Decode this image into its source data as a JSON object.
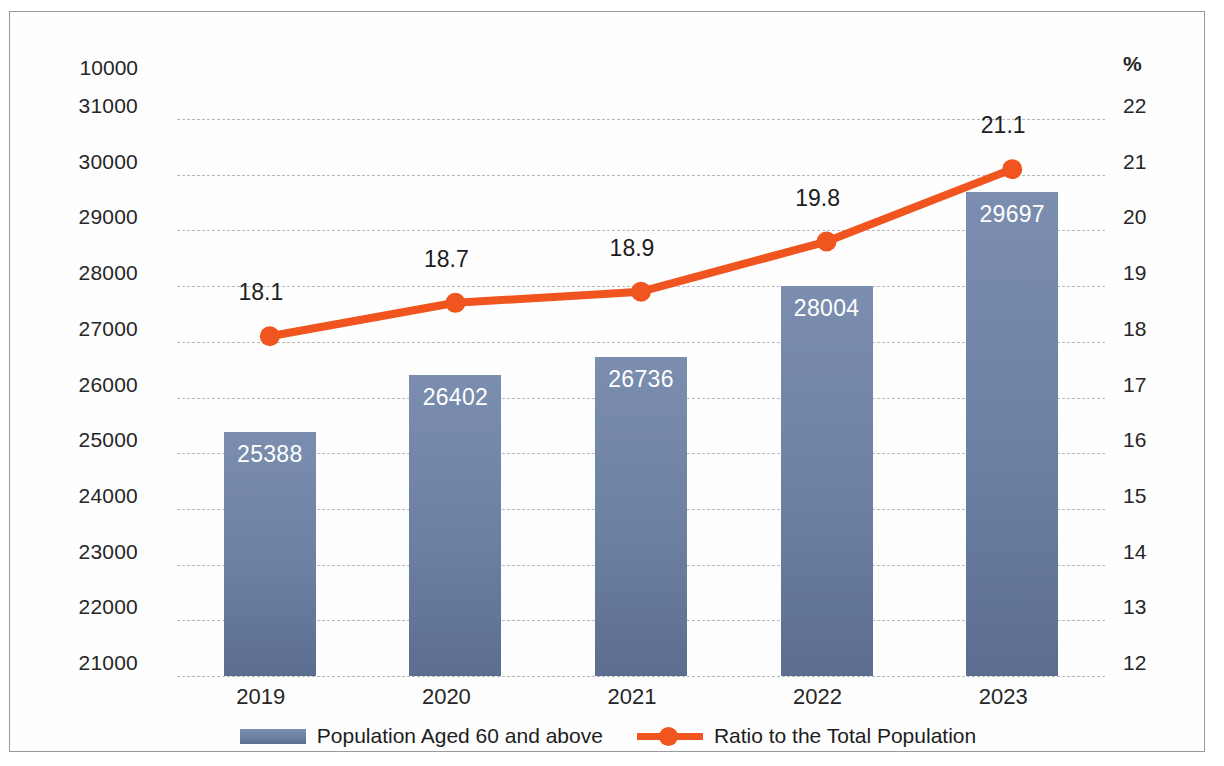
{
  "chart_data": {
    "type": "bar",
    "title": "",
    "categories": [
      "2019",
      "2020",
      "2021",
      "2022",
      "2023"
    ],
    "series": [
      {
        "name": "Population Aged 60 and above",
        "type": "bar",
        "axis": "left",
        "values": [
          25388,
          26402,
          26736,
          28004,
          29697
        ],
        "color": "#6c80a2"
      },
      {
        "name": "Ratio to the Total Population",
        "type": "line",
        "axis": "right",
        "values": [
          18.1,
          18.7,
          18.9,
          19.8,
          21.1
        ],
        "color": "#f0541f"
      }
    ],
    "xlabel": "",
    "ylabel_left": "10000",
    "ylabel_right": "%",
    "ylim_left": [
      21000,
      31000
    ],
    "ylim_right": [
      12,
      22
    ],
    "ytick_left": [
      "31000",
      "30000",
      "29000",
      "28000",
      "27000",
      "26000",
      "25000",
      "24000",
      "23000",
      "22000",
      "21000"
    ],
    "ytick_right": [
      "22",
      "21",
      "20",
      "19",
      "18",
      "17",
      "16",
      "15",
      "14",
      "13",
      "12"
    ],
    "grid": true,
    "legend_position": "bottom"
  },
  "axes": {
    "left_unit": "10000",
    "right_unit": "%",
    "left_ticks": [
      {
        "label": "31000",
        "value": 31000
      },
      {
        "label": "30000",
        "value": 30000
      },
      {
        "label": "29000",
        "value": 29000
      },
      {
        "label": "28000",
        "value": 28000
      },
      {
        "label": "27000",
        "value": 27000
      },
      {
        "label": "26000",
        "value": 26000
      },
      {
        "label": "25000",
        "value": 25000
      },
      {
        "label": "24000",
        "value": 24000
      },
      {
        "label": "23000",
        "value": 23000
      },
      {
        "label": "22000",
        "value": 22000
      },
      {
        "label": "21000",
        "value": 21000
      }
    ],
    "right_ticks": [
      {
        "label": "22",
        "value": 22
      },
      {
        "label": "21",
        "value": 21
      },
      {
        "label": "20",
        "value": 20
      },
      {
        "label": "19",
        "value": 19
      },
      {
        "label": "18",
        "value": 18
      },
      {
        "label": "17",
        "value": 17
      },
      {
        "label": "16",
        "value": 16
      },
      {
        "label": "15",
        "value": 15
      },
      {
        "label": "14",
        "value": 14
      },
      {
        "label": "13",
        "value": 13
      },
      {
        "label": "12",
        "value": 12
      }
    ],
    "categories": [
      {
        "label": "2019"
      },
      {
        "label": "2020"
      },
      {
        "label": "2021"
      },
      {
        "label": "2022"
      },
      {
        "label": "2023"
      }
    ]
  },
  "bars": [
    {
      "category": "2019",
      "value": 25388,
      "label": "25388"
    },
    {
      "category": "2020",
      "value": 26402,
      "label": "26402"
    },
    {
      "category": "2021",
      "value": 26736,
      "label": "26736"
    },
    {
      "category": "2022",
      "value": 28004,
      "label": "28004"
    },
    {
      "category": "2023",
      "value": 29697,
      "label": "29697"
    }
  ],
  "line_points": [
    {
      "category": "2019",
      "value": 18.1,
      "label": "18.1"
    },
    {
      "category": "2020",
      "value": 18.7,
      "label": "18.7"
    },
    {
      "category": "2021",
      "value": 18.9,
      "label": "18.9"
    },
    {
      "category": "2022",
      "value": 19.8,
      "label": "19.8"
    },
    {
      "category": "2023",
      "value": 21.1,
      "label": "21.1"
    }
  ],
  "legend": {
    "items": [
      {
        "label": "Population Aged 60 and above",
        "type": "bar",
        "color": "#6c80a2"
      },
      {
        "label": "Ratio to the Total Population",
        "type": "line",
        "color": "#f0541f"
      }
    ]
  },
  "colors": {
    "bar": "#6c80a2",
    "line": "#f0541f",
    "grid": "#b9b9b9",
    "text": "#262626",
    "frame": "#9a9a9a"
  }
}
